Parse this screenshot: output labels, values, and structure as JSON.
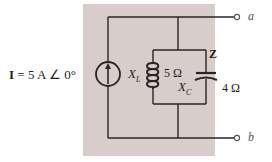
{
  "diagram": {
    "type": "circuit-schematic",
    "source": {
      "symbol": "I",
      "equals": "=",
      "magnitude": "5 A",
      "angle_symbol": "∠",
      "phase": "0°",
      "label_full": "I = 5 A ∠ 0°",
      "icon": "current-source-arrow-up-icon"
    },
    "inductor": {
      "label": "X",
      "subscript": "L",
      "value": "5 Ω",
      "icon": "inductor-coil-icon"
    },
    "capacitor": {
      "label": "X",
      "subscript": "C",
      "value": "4 Ω",
      "icon": "capacitor-icon"
    },
    "impedance_label": "Z",
    "terminals": {
      "a": "a",
      "b": "b"
    },
    "colors": {
      "background_panel": "#d9cdcb",
      "wire": "#2b2324",
      "text": "#231f20",
      "terminal_text": "#555555"
    }
  }
}
